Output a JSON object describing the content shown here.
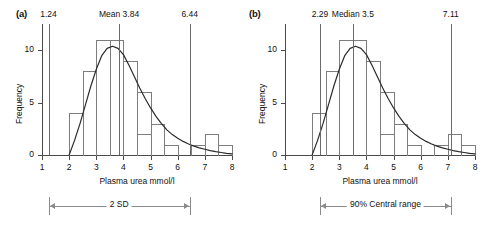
{
  "figure": {
    "panels": [
      {
        "label": "(a)",
        "xlabel": "Plasma urea mmol/l",
        "ylabel": "Frequency",
        "ref_lines": [
          {
            "value": 1.24,
            "label": "1.24"
          },
          {
            "value": 3.84,
            "label": "Mean 3.84"
          },
          {
            "value": 6.44,
            "label": "6.44"
          }
        ],
        "range_label": "2 SD",
        "range_from": 1.24,
        "range_to": 6.44
      },
      {
        "label": "(b)",
        "xlabel": "Plasma urea mmol/l",
        "ylabel": "Frequency",
        "ref_lines": [
          {
            "value": 2.29,
            "label": "2.29"
          },
          {
            "value": 3.5,
            "label": "Median 3.5"
          },
          {
            "value": 7.11,
            "label": "7.11"
          }
        ],
        "range_label": "90% Central range",
        "range_from": 2.29,
        "range_to": 7.11
      }
    ]
  },
  "chart_data": {
    "type": "bar",
    "title": "",
    "xlabel": "Plasma urea mmol/l",
    "ylabel": "Frequency",
    "xlim": [
      1,
      8
    ],
    "ylim": [
      0,
      11
    ],
    "xticks": [
      1,
      2,
      3,
      4,
      5,
      6,
      7,
      8
    ],
    "yticks": [
      0,
      5,
      10
    ],
    "grid": false,
    "legend": "none",
    "bin_width": 0.5,
    "bin_starts": [
      2.0,
      2.5,
      3.0,
      3.5,
      4.0,
      4.5,
      5.0,
      5.5,
      6.0,
      6.5,
      7.0,
      7.5
    ],
    "values": [
      4,
      8,
      11,
      11,
      9,
      6,
      2,
      3,
      1,
      0,
      1,
      2,
      1
    ],
    "bars": [
      {
        "from": 2.0,
        "to": 2.5,
        "height": 4
      },
      {
        "from": 2.5,
        "to": 3.0,
        "height": 8
      },
      {
        "from": 3.0,
        "to": 3.5,
        "height": 11
      },
      {
        "from": 3.5,
        "to": 4.0,
        "height": 11
      },
      {
        "from": 4.0,
        "to": 4.5,
        "height": 9
      },
      {
        "from": 4.5,
        "to": 5.0,
        "height": 6
      },
      {
        "from": 4.5,
        "to": 5.0,
        "height": 2
      },
      {
        "from": 5.0,
        "to": 5.5,
        "height": 3
      },
      {
        "from": 5.5,
        "to": 6.0,
        "height": 1
      },
      {
        "from": 6.5,
        "to": 7.0,
        "height": 1
      },
      {
        "from": 7.0,
        "to": 7.5,
        "height": 2
      },
      {
        "from": 7.5,
        "to": 8.0,
        "height": 1
      }
    ],
    "curve": {
      "name": "fitted skewed distribution",
      "points": [
        [
          2.0,
          0.0
        ],
        [
          2.2,
          1.4
        ],
        [
          2.4,
          3.0
        ],
        [
          2.6,
          4.8
        ],
        [
          2.8,
          6.6
        ],
        [
          3.0,
          8.2
        ],
        [
          3.2,
          9.5
        ],
        [
          3.4,
          10.2
        ],
        [
          3.6,
          10.4
        ],
        [
          3.8,
          10.2
        ],
        [
          4.0,
          9.6
        ],
        [
          4.2,
          8.6
        ],
        [
          4.4,
          7.5
        ],
        [
          4.6,
          6.4
        ],
        [
          4.8,
          5.4
        ],
        [
          5.0,
          4.5
        ],
        [
          5.2,
          3.7
        ],
        [
          5.4,
          3.0
        ],
        [
          5.6,
          2.4
        ],
        [
          5.8,
          1.95
        ],
        [
          6.0,
          1.6
        ],
        [
          6.2,
          1.3
        ],
        [
          6.4,
          1.05
        ],
        [
          6.6,
          0.85
        ],
        [
          6.8,
          0.68
        ],
        [
          7.0,
          0.55
        ],
        [
          7.2,
          0.42
        ],
        [
          7.4,
          0.32
        ],
        [
          7.6,
          0.24
        ],
        [
          7.8,
          0.16
        ],
        [
          8.0,
          0.1
        ]
      ]
    },
    "annotations": [
      {
        "panel": "(a)",
        "text": "1.24",
        "x": 1.24,
        "type": "reference-line"
      },
      {
        "panel": "(a)",
        "text": "Mean 3.84",
        "x": 3.84,
        "type": "reference-line"
      },
      {
        "panel": "(a)",
        "text": "6.44",
        "x": 6.44,
        "type": "reference-line"
      },
      {
        "panel": "(a)",
        "text": "2 SD",
        "from": 1.24,
        "to": 6.44,
        "type": "range-bar"
      },
      {
        "panel": "(b)",
        "text": "2.29",
        "x": 2.29,
        "type": "reference-line"
      },
      {
        "panel": "(b)",
        "text": "Median 3.5",
        "x": 3.5,
        "type": "reference-line"
      },
      {
        "panel": "(b)",
        "text": "7.11",
        "x": 7.11,
        "type": "reference-line"
      },
      {
        "panel": "(b)",
        "text": "90% Central range",
        "from": 2.29,
        "to": 7.11,
        "type": "range-bar"
      }
    ]
  }
}
